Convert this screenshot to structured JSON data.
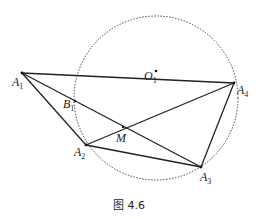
{
  "figure": {
    "caption": "图 4.6",
    "circle": {
      "center": [
        156,
        98
      ],
      "radius": 82,
      "style": "dotted",
      "center_label": "O",
      "center_label_sub": "1"
    },
    "points": {
      "A1": {
        "label": "A",
        "sub": "1",
        "xy": [
          22,
          73
        ]
      },
      "A2": {
        "label": "A",
        "sub": "2",
        "xy": [
          86,
          145
        ]
      },
      "A3": {
        "label": "A",
        "sub": "3",
        "xy": [
          201,
          167
        ]
      },
      "A4": {
        "label": "A",
        "sub": "4",
        "xy": [
          234,
          83
        ]
      },
      "B1": {
        "label": "B",
        "sub": "1",
        "xy": [
          75,
          95
        ]
      },
      "M": {
        "label": "M",
        "xy": [
          122,
          128
        ]
      },
      "O1": {
        "label": "O",
        "sub": "1",
        "xy": [
          156,
          74
        ]
      }
    },
    "segments": [
      [
        "A1",
        "A4"
      ],
      [
        "A1",
        "A3"
      ],
      [
        "A1",
        "A2"
      ],
      [
        "A2",
        "A4"
      ],
      [
        "A2",
        "A3"
      ],
      [
        "A3",
        "A4"
      ]
    ]
  }
}
